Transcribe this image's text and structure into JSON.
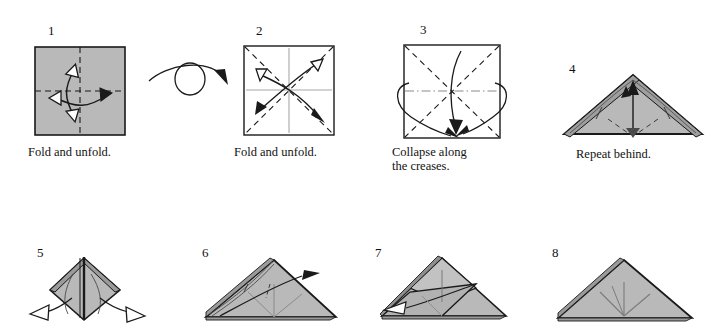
{
  "document": {
    "type": "origami-instruction-diagram",
    "title": "",
    "background_color": "#ffffff",
    "ink_color": "#1a1a1a",
    "paper_gray": "#b9b9b9",
    "paper_gray_shadow": "#a0a0a0",
    "paper_white": "#ffffff",
    "crease_gray": "#9a9a9a"
  },
  "steps": [
    {
      "number": "1",
      "caption": "Fold and unfold.",
      "shape": "square",
      "fill": "gray",
      "creases": [
        "vertical-dashed-center",
        "horizontal-dashed-center"
      ],
      "arrows": [
        "double-headed-vertical-fold-unfold",
        "double-headed-horizontal-fold-unfold"
      ]
    },
    {
      "number": "2",
      "caption": "Fold and unfold.",
      "shape": "square",
      "fill": "white",
      "creases": [
        "diagonal-dashed-both",
        "vertical-gray-center",
        "horizontal-gray-center"
      ],
      "arrows": [
        "double-headed-diagonal-up",
        "double-headed-diagonal-down"
      ]
    },
    {
      "number": "3",
      "caption": "Collapse along\nthe creases.",
      "shape": "square",
      "fill": "white",
      "creases": [
        "diagonal-dashed-both",
        "horizontal-dash-dot-center"
      ],
      "arrows": [
        "wrap-around-left",
        "wrap-around-right",
        "collapse-down-center"
      ]
    },
    {
      "number": "4",
      "caption": "Repeat behind.",
      "shape": "triangle",
      "fill": "gray",
      "creases": [
        "petal-fold-lines",
        "dashed-valley-lines"
      ],
      "arrows": [
        "up-arrow-center"
      ]
    },
    {
      "number": "5",
      "caption": "",
      "shape": "diamond",
      "fill": "gray",
      "creases": [
        "vertical-center-spine"
      ],
      "arrows": [
        "pull-out-left",
        "pull-out-right"
      ]
    },
    {
      "number": "6",
      "caption": "",
      "shape": "triangle",
      "fill": "gray",
      "creases": [
        "fan-lines",
        "dashed-line"
      ],
      "arrows": [
        "fold-over-right"
      ]
    },
    {
      "number": "7",
      "caption": "",
      "shape": "triangle-with-flap",
      "fill": "gray",
      "creases": [
        "flap-edges"
      ],
      "arrows": [
        "fold-left"
      ]
    },
    {
      "number": "8",
      "caption": "",
      "shape": "triangle",
      "fill": "gray",
      "creases": [
        "three-fan-lines"
      ],
      "arrows": []
    }
  ],
  "symbols": {
    "turn_over": {
      "name": "turn-over-symbol",
      "description": "circle with arc arrow over it"
    }
  }
}
